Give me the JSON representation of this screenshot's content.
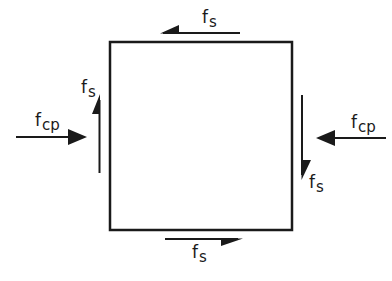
{
  "diagram": {
    "type": "stress-element",
    "colors": {
      "stroke": "#1a1a1a",
      "background": "#ffffff"
    },
    "element": {
      "shape": "square",
      "x": 110,
      "y": 42,
      "width": 182,
      "height": 188
    },
    "labels": {
      "shear_top": {
        "base": "f",
        "sub": "s"
      },
      "shear_left": {
        "base": "f",
        "sub": "s"
      },
      "shear_right": {
        "base": "f",
        "sub": "s"
      },
      "shear_bottom": {
        "base": "f",
        "sub": "s"
      },
      "comp_left": {
        "base": "f",
        "sub": "cp"
      },
      "comp_right": {
        "base": "f",
        "sub": "cp"
      }
    },
    "arrows": [
      {
        "name": "shear-top-arrow",
        "direction": "left",
        "label": "shear_top"
      },
      {
        "name": "shear-left-arrow",
        "direction": "up",
        "label": "shear_left"
      },
      {
        "name": "shear-right-arrow",
        "direction": "down",
        "label": "shear_right"
      },
      {
        "name": "shear-bottom-arrow",
        "direction": "right",
        "label": "shear_bottom"
      },
      {
        "name": "compression-left-arrow",
        "direction": "right",
        "label": "comp_left"
      },
      {
        "name": "compression-right-arrow",
        "direction": "left",
        "label": "comp_right"
      }
    ]
  }
}
